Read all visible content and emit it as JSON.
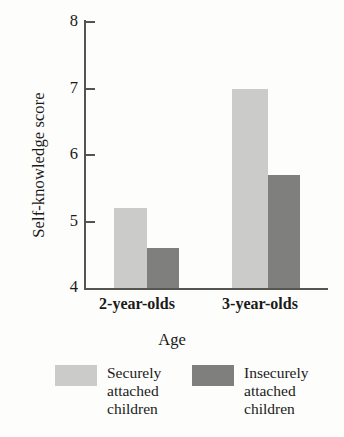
{
  "chart_data": {
    "type": "bar",
    "title": "",
    "subtitle": "",
    "xlabel": "Age",
    "ylabel": "Self-knowledge score",
    "categories": [
      "2-year-olds",
      "3-year-olds"
    ],
    "series": [
      {
        "name": "Securely attached children",
        "color": "#cbcbc9",
        "values": [
          5.2,
          7.0
        ]
      },
      {
        "name": "Insecurely attached children",
        "color": "#7f7f7d",
        "values": [
          4.6,
          5.7
        ]
      }
    ],
    "ylim": [
      4,
      8
    ],
    "yticks": [
      4,
      5,
      6,
      7,
      8
    ],
    "ytick_labels": [
      "4",
      "5",
      "6",
      "7",
      "8"
    ],
    "grid": false,
    "legend_position": "bottom",
    "legend": [
      {
        "label": "Securely\nattached\nchildren",
        "color": "#cbcbc9"
      },
      {
        "label": "Insecurely\nattached\nchildren",
        "color": "#7f7f7d"
      }
    ]
  },
  "colors": {
    "background": "#fdfdfb",
    "axis": "#55554f",
    "text": "#1a1a1a",
    "series_light": "#cbcbc9",
    "series_dark": "#7f7f7d"
  }
}
